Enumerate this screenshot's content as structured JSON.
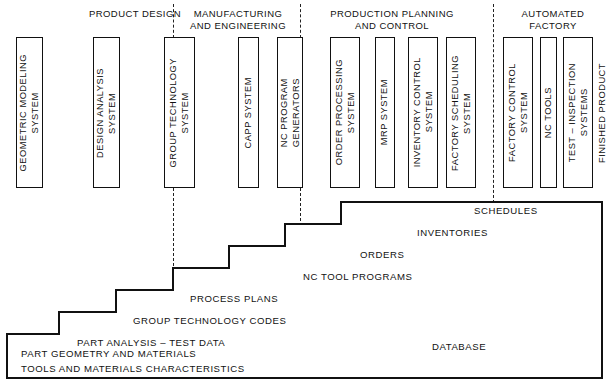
{
  "diagram": {
    "canvas": {
      "width": 611,
      "height": 392
    },
    "line_color": "#111111"
  },
  "sections": [
    {
      "id": "product-design",
      "label": "PRODUCT DESIGN",
      "x": 60,
      "y": 8,
      "width": 150
    },
    {
      "id": "manufacturing-engineering",
      "label": "MANUFACTURING\nAND ENGINEERING",
      "x": 178,
      "y": 8,
      "width": 120
    },
    {
      "id": "production-planning-control",
      "label": "PRODUCTION PLANNING\nAND CONTROL",
      "x": 312,
      "y": 8,
      "width": 160
    },
    {
      "id": "automated-factory",
      "label": "AUTOMATED\nFACTORY",
      "x": 505,
      "y": 8,
      "width": 96
    }
  ],
  "dividers": [
    {
      "id": "divider-1",
      "x": 173,
      "y": 4,
      "height": 34
    },
    {
      "id": "divider-1b",
      "x": 173,
      "y": 188,
      "height": 113
    },
    {
      "id": "divider-2",
      "x": 300,
      "y": 4,
      "height": 34
    },
    {
      "id": "divider-2b",
      "x": 300,
      "y": 188,
      "height": 58
    },
    {
      "id": "divider-3",
      "x": 493,
      "y": 4,
      "height": 184
    },
    {
      "id": "divider-3b",
      "x": 493,
      "y": 188,
      "height": 15
    }
  ],
  "boxes": [
    {
      "id": "geometric-modeling-system",
      "label": "GEOMETRIC MODELING\nSYSTEM",
      "x": 16,
      "y": 37,
      "width": 27,
      "height": 151
    },
    {
      "id": "design-analysis-system",
      "label": "DESIGN ANALYSIS\nSYSTEM",
      "x": 93,
      "y": 37,
      "width": 27,
      "height": 151
    },
    {
      "id": "group-technology-system",
      "label": "GROUP TECHNOLOGY\nSYSTEM",
      "x": 164,
      "y": 37,
      "width": 31,
      "height": 151
    },
    {
      "id": "capp-system",
      "label": "CAPP SYSTEM",
      "x": 238,
      "y": 37,
      "width": 21,
      "height": 151
    },
    {
      "id": "nc-program-generators",
      "label": "NC PROGRAM\nGENERATORS",
      "x": 277,
      "y": 37,
      "width": 26,
      "height": 151
    },
    {
      "id": "order-processing-system",
      "label": "ORDER PROCESSING\nSYSTEM",
      "x": 330,
      "y": 37,
      "width": 30,
      "height": 151
    },
    {
      "id": "mrp-system",
      "label": "MRP SYSTEM",
      "x": 375,
      "y": 37,
      "width": 20,
      "height": 151
    },
    {
      "id": "inventory-control-system",
      "label": "INVENTORY CONTROL\nSYSTEM",
      "x": 408,
      "y": 37,
      "width": 30,
      "height": 151
    },
    {
      "id": "factory-scheduling-system",
      "label": "FACTORY SCHEDULING\nSYSTEM",
      "x": 446,
      "y": 37,
      "width": 30,
      "height": 151
    },
    {
      "id": "factory-control-system",
      "label": "FACTORY CONTROL\nSYSTEM",
      "x": 503,
      "y": 37,
      "width": 30,
      "height": 151
    },
    {
      "id": "nc-tools",
      "label": "NC TOOLS",
      "x": 540,
      "y": 37,
      "width": 17,
      "height": 151
    },
    {
      "id": "test-inspection-systems",
      "label": "TEST – INSPECTION\nSYSTEMS",
      "x": 563,
      "y": 37,
      "width": 30,
      "height": 151
    }
  ],
  "plain_labels": [
    {
      "id": "finished-product",
      "label": "FINISHED PRODUCT",
      "x": 594,
      "y": 37,
      "width": 17,
      "height": 151
    }
  ],
  "staircase": {
    "outline_points": "455,202 602,202 602,378 7,378 7,334 59,334 59,312 116,312 116,290 173,290 173,268 229,268 229,246 285,246 285,224 340,224 340,224 398,224 398,224",
    "path": "M 455 202 L 602 202 L 602 378 L 7 378 L 7 334 L 59 334 L 59 312 L 116 312 L 116 290 L 173 290 L 173 268 L 229 268 L 229 246 L 285 246 L 285 224 L 341 224 L 341 202 L 455 202 Z",
    "fix_path": "M 7 378 L 7 334 L 59 334 L 59 312 L 116 312 L 116 290 L 173 290 L 173 268 L 229 268 L 229 246 L 285 246 L 285 224 L 341 224 L 341 202 L 455 202"
  },
  "tiers": [
    {
      "id": "tier-schedules",
      "label": "SCHEDULES",
      "x": 474,
      "y": 205
    },
    {
      "id": "tier-inventories",
      "label": "INVENTORIES",
      "x": 417,
      "y": 227
    },
    {
      "id": "tier-orders",
      "label": "ORDERS",
      "x": 360,
      "y": 249
    },
    {
      "id": "tier-nc-tool-programs",
      "label": "NC TOOL PROGRAMS",
      "x": 303,
      "y": 271
    },
    {
      "id": "tier-process-plans",
      "label": "PROCESS PLANS",
      "x": 190,
      "y": 293
    },
    {
      "id": "tier-group-technology-codes",
      "label": "GROUP TECHNOLOGY CODES",
      "x": 133,
      "y": 315
    },
    {
      "id": "tier-part-analysis-test-data",
      "label": "PART ANALYSIS – TEST DATA",
      "x": 77,
      "y": 337
    },
    {
      "id": "tier-part-geometry-and-materials",
      "label": "PART GEOMETRY AND MATERIALS",
      "x": 21,
      "y": 359
    },
    {
      "id": "tier-tools-and-materials-characteristics",
      "label": "TOOLS AND MATERIALS CHARACTERISTICS",
      "x": 21,
      "y": 370
    }
  ],
  "database": {
    "id": "database-label",
    "label": "DATABASE",
    "x": 432,
    "y": 341
  }
}
